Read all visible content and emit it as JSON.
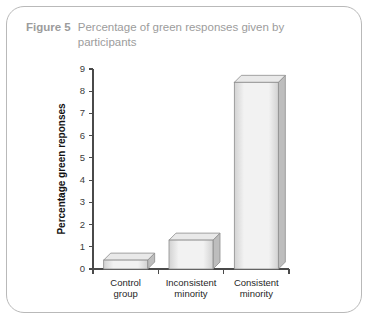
{
  "caption": {
    "label": "Figure 5",
    "text": "Percentage of green responses given by participants"
  },
  "colors": {
    "caption": "#9c9c9c",
    "frame_border": "#b9b9b9",
    "axis": "#4a4a4a",
    "bar_face_light": "#f2f2f2",
    "bar_face_dark": "#d2d2d2",
    "bar_edge": "#8d8d8d",
    "bar_side": "#bdbdbd",
    "bar_top": "#e9e9e9"
  },
  "chart_data": {
    "type": "bar",
    "title": "Percentage of green responses given by participants",
    "categories": [
      "Control group",
      "Inconsistent minority",
      "Consistent minority"
    ],
    "category_lines": [
      [
        "Control",
        "group"
      ],
      [
        "Inconsistent",
        "minority"
      ],
      [
        "Consistent",
        "minority"
      ]
    ],
    "values": [
      0.4,
      1.3,
      8.4
    ],
    "xlabel": "",
    "ylabel": "Percentage green reponses",
    "ylim": [
      0,
      9
    ],
    "yticks": [
      0,
      1,
      2,
      3,
      4,
      5,
      6,
      7,
      8,
      9
    ],
    "ytick_labels": [
      "0",
      "1",
      "2",
      "3",
      "4",
      "5",
      "6",
      "7",
      "8",
      "9"
    ],
    "grid": false,
    "legend": false,
    "style": "3d-bars"
  }
}
